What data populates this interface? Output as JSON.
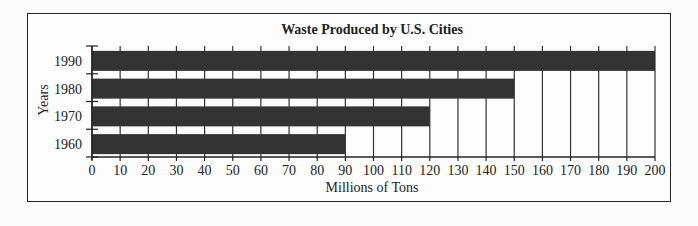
{
  "chart_data": {
    "type": "bar",
    "orientation": "horizontal",
    "title": "Waste Produced by U.S. Cities",
    "xlabel": "Millions of Tons",
    "ylabel": "Years",
    "categories": [
      "1990",
      "1980",
      "1970",
      "1960"
    ],
    "values": [
      200,
      150,
      120,
      90
    ],
    "xlim": [
      0,
      200
    ],
    "xticks": [
      0,
      10,
      20,
      30,
      40,
      50,
      60,
      70,
      80,
      90,
      100,
      110,
      120,
      130,
      140,
      150,
      160,
      170,
      180,
      190,
      200
    ],
    "grid": true,
    "legend": null,
    "bar_color": "#333333"
  }
}
